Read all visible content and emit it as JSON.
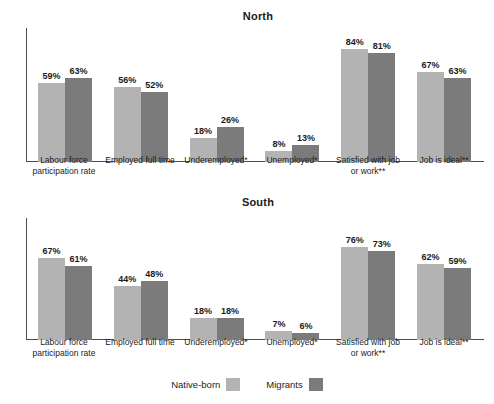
{
  "chart_data": {
    "type": "bar",
    "title": "",
    "xlabel": "",
    "ylabel": "",
    "ylim": [
      0,
      100
    ],
    "grid": false,
    "legend_position": "bottom",
    "legend": [
      "Native-born",
      "Migrants"
    ],
    "colors": {
      "native": "#b3b3b3",
      "migrant": "#7b7b7b",
      "axis": "#4d4d4d",
      "text": "#1b1b1b"
    },
    "categories": [
      "Labour force participation rate",
      "Employed full time",
      "Underemployed*",
      "Unemployed*",
      "Satisfied with job or work**",
      "Job is ideal**"
    ],
    "panels": [
      {
        "title": "North",
        "series": [
          {
            "name": "Native-born",
            "values": [
              59,
              56,
              18,
              8,
              84,
              67
            ],
            "labels": [
              "59%",
              "56%",
              "18%",
              "8%",
              "84%",
              "67%"
            ]
          },
          {
            "name": "Migrants",
            "values": [
              63,
              52,
              26,
              13,
              81,
              63
            ],
            "labels": [
              "63%",
              "52%",
              "26%",
              "13%",
              "81%",
              "63%"
            ]
          }
        ]
      },
      {
        "title": "South",
        "series": [
          {
            "name": "Native-born",
            "values": [
              67,
              44,
              18,
              7,
              76,
              62
            ],
            "labels": [
              "67%",
              "44%",
              "18%",
              "7%",
              "76%",
              "62%"
            ]
          },
          {
            "name": "Migrants",
            "values": [
              61,
              48,
              18,
              6,
              73,
              59
            ],
            "labels": [
              "61%",
              "48%",
              "18%",
              "6%",
              "73%",
              "59%"
            ]
          }
        ]
      }
    ]
  },
  "north": {
    "title": "North",
    "cats": [
      "Labour force participation rate",
      "Employed full time",
      "Underemployed*",
      "Unemployed*",
      "Satisfied with job or work**",
      "Job is ideal**"
    ],
    "native_labels": [
      "59%",
      "56%",
      "18%",
      "8%",
      "84%",
      "67%"
    ],
    "migrant_labels": [
      "63%",
      "52%",
      "26%",
      "13%",
      "81%",
      "63%"
    ]
  },
  "south": {
    "title": "South",
    "cats": [
      "Labour force participation rate",
      "Employed full time",
      "Underemployed*",
      "Unemployed*",
      "Satisfied with job or work**",
      "Job is ideal**"
    ],
    "native_labels": [
      "67%",
      "44%",
      "18%",
      "7%",
      "76%",
      "62%"
    ],
    "migrant_labels": [
      "61%",
      "48%",
      "18%",
      "6%",
      "73%",
      "59%"
    ]
  },
  "legend": {
    "native_label": "Native-born",
    "migrant_label": "Migrants"
  }
}
